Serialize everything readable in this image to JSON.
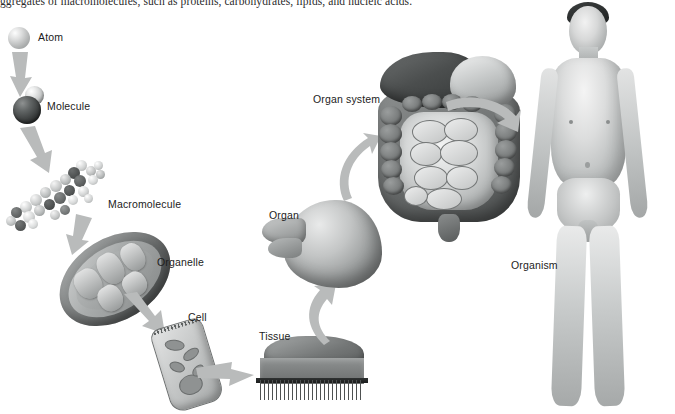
{
  "figure": {
    "caption_partial": "ggregates of macromolecules, such as proteins, carbohydrates, lipids, and nucleic acids.",
    "background_color": "#ffffff",
    "arrow_color": "#b9bbbb",
    "label_color": "#1c1c1c"
  },
  "levels": [
    {
      "id": "atom",
      "label": "Atom",
      "order": 1,
      "art": "single-sphere"
    },
    {
      "id": "molecule",
      "label": "Molecule",
      "order": 2,
      "art": "two-spheres"
    },
    {
      "id": "macromolecule",
      "label": "Macromolecule",
      "order": 3,
      "art": "space-filling-model"
    },
    {
      "id": "organelle",
      "label": "Organelle",
      "order": 4,
      "art": "mitochondrion"
    },
    {
      "id": "cell",
      "label": "Cell",
      "order": 5,
      "art": "epithelial-cell"
    },
    {
      "id": "tissue",
      "label": "Tissue",
      "order": 6,
      "art": "epithelial-tissue-block"
    },
    {
      "id": "organ",
      "label": "Organ",
      "order": 7,
      "art": "stomach"
    },
    {
      "id": "organ_system",
      "label": "Organ system",
      "order": 8,
      "art": "digestive-system"
    },
    {
      "id": "organism",
      "label": "Organism",
      "order": 9,
      "art": "human-body"
    }
  ],
  "arrows": [
    {
      "id": "atom-to-molecule",
      "from": "atom",
      "to": "molecule",
      "direction": "down"
    },
    {
      "id": "molecule-to-macromolecule",
      "from": "molecule",
      "to": "macromolecule",
      "direction": "down"
    },
    {
      "id": "macromolecule-to-organelle",
      "from": "macromolecule",
      "to": "organelle",
      "direction": "down"
    },
    {
      "id": "organelle-to-cell",
      "from": "organelle",
      "to": "cell",
      "direction": "down-right"
    },
    {
      "id": "cell-to-tissue",
      "from": "cell",
      "to": "tissue",
      "direction": "right"
    },
    {
      "id": "tissue-to-organ",
      "from": "tissue",
      "to": "organ",
      "direction": "up-curved"
    },
    {
      "id": "organ-to-organ-system",
      "from": "organ",
      "to": "organ_system",
      "direction": "up-curved"
    },
    {
      "id": "organ-system-to-organism",
      "from": "organ_system",
      "to": "organism",
      "direction": "right-curved"
    }
  ]
}
